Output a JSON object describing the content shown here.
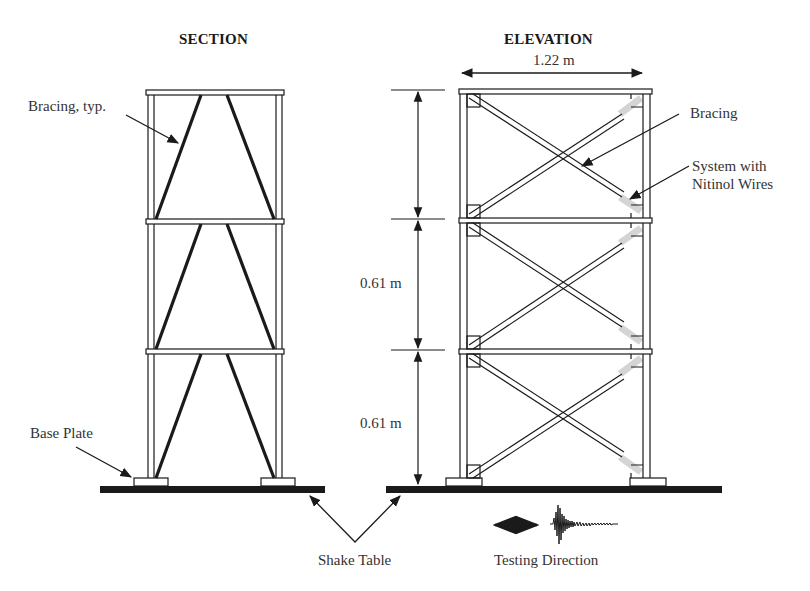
{
  "figure": {
    "cropped_caption_fragment": "",
    "section": {
      "title": "SECTION",
      "labels": {
        "bracing": "Bracing, typ.",
        "base_plate": "Base Plate"
      },
      "stories": 3
    },
    "elevation": {
      "title": "ELEVATION",
      "width_dimension": "1.22 m",
      "story_dimensions": [
        "0.61 m",
        "0.61 m"
      ],
      "labels": {
        "bracing": "Bracing",
        "nitinol": [
          "System with",
          "Nitinol Wires"
        ]
      },
      "stories": 3
    },
    "shake_table_label": "Shake Table",
    "testing_direction_label": "Testing Direction",
    "colors": {
      "line": "#1a1a1a",
      "nitinol_highlight": "#d4d4d4",
      "background": "#ffffff"
    }
  }
}
